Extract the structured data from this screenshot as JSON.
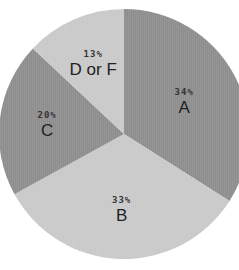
{
  "chart_data": {
    "type": "pie",
    "title": "",
    "categories": [
      "A",
      "B",
      "C",
      "D or F"
    ],
    "values": [
      34,
      33,
      20,
      13
    ],
    "labels": [
      "34%",
      "33%",
      "20%",
      "13%"
    ],
    "colors": [
      "#8e8e8e",
      "#c9c9c9",
      "#8e8e8e",
      "#c9c9c9"
    ],
    "start_angle_deg": 0,
    "direction": "clockwise",
    "legend": "none"
  },
  "slices": [
    {
      "name": "A",
      "pct": "34%"
    },
    {
      "name": "B",
      "pct": "33%"
    },
    {
      "name": "C",
      "pct": "20%"
    },
    {
      "name": "D or F",
      "pct": "13%"
    }
  ]
}
